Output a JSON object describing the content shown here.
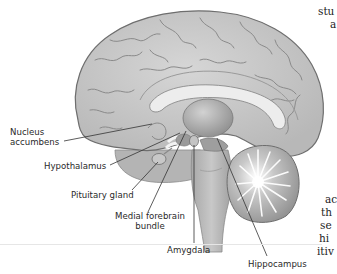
{
  "diagram": {
    "colors": {
      "cortex": "#c9c9c9",
      "cortex_outline": "#6e6e6e",
      "corpus_callosum": "#ececec",
      "thalamus": "#b3b3b3",
      "brainstem": "#bdbdbd",
      "cerebellum": "#a9a9a9",
      "leader_line": "#333333",
      "label_text": "#2a2a2a"
    },
    "labels": [
      {
        "id": "nucleus-accumbens",
        "lines": [
          "Nucleus",
          "accumbens"
        ]
      },
      {
        "id": "hypothalamus",
        "lines": [
          "Hypothalamus"
        ]
      },
      {
        "id": "pituitary-gland",
        "lines": [
          "Pituitary gland"
        ]
      },
      {
        "id": "medial-forebrain-bundle",
        "lines": [
          "Medial forebrain",
          "bundle"
        ]
      },
      {
        "id": "amygdala",
        "lines": [
          "Amygdala"
        ]
      },
      {
        "id": "hippocampus",
        "lines": [
          "Hippocampus"
        ]
      }
    ]
  },
  "side_text": {
    "top": [
      "stu",
      "a"
    ],
    "bottom": [
      "ac",
      "th",
      "se",
      "hi",
      "itiv"
    ]
  }
}
